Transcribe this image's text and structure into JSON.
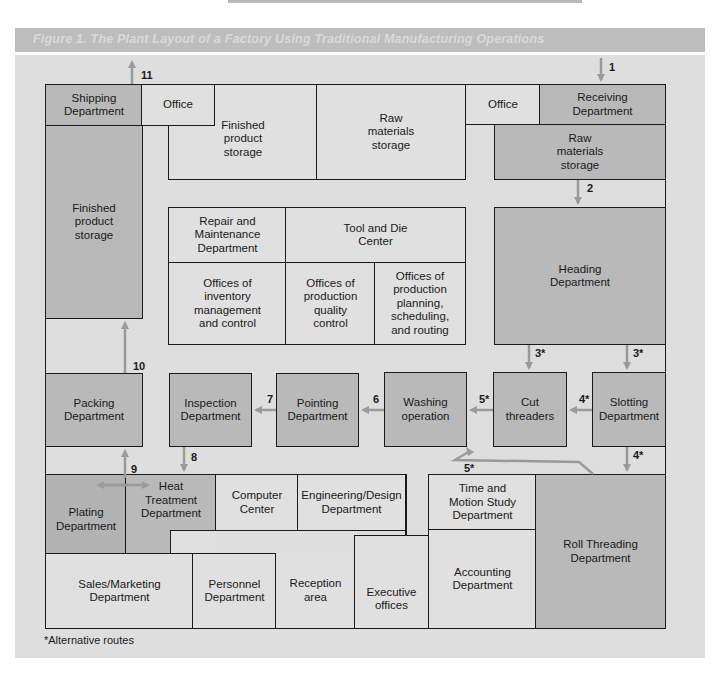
{
  "title": "Figure 1. The Plant Layout of a Factory Using Traditional Manufacturing Operations",
  "footnote": "*Alternative routes",
  "colors": {
    "panel_bg": "#dedede",
    "light_room": "#e0e0e0",
    "dark_room": "#b9b9b9",
    "arrow": "#9a9a9a",
    "border": "#1a1a1a",
    "title_bar": "#bdbdbd"
  },
  "rooms": {
    "shipping": "Shipping\nDepartment",
    "office_left": "Office",
    "finished_storage_top": "Finished\nproduct\nstorage",
    "raw_storage_top": "Raw\nmaterials\nstorage",
    "office_right": "Office",
    "receiving": "Receiving\nDepartment",
    "raw_storage_right": "Raw\nmaterials\nstorage",
    "finished_storage_left": "Finished\nproduct\nstorage",
    "repair": "Repair and\nMaintenance\nDepartment",
    "tool_die": "Tool and Die\nCenter",
    "inventory_offices": "Offices of\ninventory\nmanagement\nand control",
    "quality_offices": "Offices of\nproduction\nquality\ncontrol",
    "planning_offices": "Offices of\nproduction\nplanning,\nscheduling,\nand routing",
    "heading": "Heading\nDepartment",
    "packing": "Packing\nDepartment",
    "inspection": "Inspection\nDepartment",
    "pointing": "Pointing\nDepartment",
    "washing": "Washing\noperation",
    "cut_threaders": "Cut\nthreaders",
    "slotting": "Slotting\nDepartment",
    "plating": "Plating\nDepartment",
    "heat_treatment": "Heat\nTreatment\nDepartment",
    "computer_center": "Computer\nCenter",
    "engineering": "Engineering/Design\nDepartment",
    "time_motion": "Time and\nMotion Study\nDepartment",
    "roll_threading": "Roll Threading\nDepartment",
    "sales": "Sales/Marketing\nDepartment",
    "personnel": "Personnel\nDepartment",
    "reception": "Reception\narea",
    "executive": "Executive\noffices",
    "accounting": "Accounting\nDepartment"
  },
  "flow_labels": {
    "s1": "1",
    "s2": "2",
    "s3a": "3*",
    "s3b": "3*",
    "s4a": "4*",
    "s4b": "4*",
    "s5a": "5*",
    "s5b": "5*",
    "s6": "6",
    "s7": "7",
    "s8": "8",
    "s9": "9",
    "s10": "10",
    "s11": "11"
  }
}
